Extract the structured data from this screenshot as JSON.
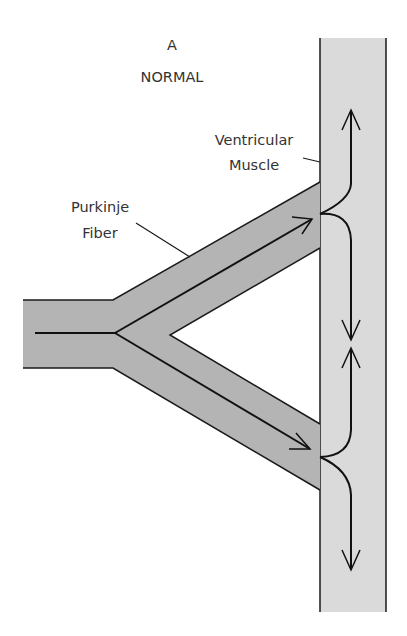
{
  "figure": {
    "panel_letter": "A",
    "panel_title": "NORMAL"
  },
  "labels": {
    "muscle_line1": "Ventricular",
    "muscle_line2": "Muscle",
    "fiber_line1": "Purkinje",
    "fiber_line2": "Fiber"
  },
  "colors": {
    "purkinje_fill": "#b4b4b4",
    "muscle_fill": "#dadada",
    "stroke": "#1a1a1a",
    "text": "#333333"
  }
}
